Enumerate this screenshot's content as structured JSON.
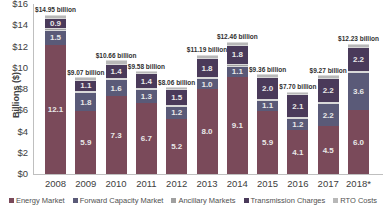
{
  "chart_data": {
    "type": "bar",
    "stacked": true,
    "title": "",
    "xlabel": "",
    "ylabel": "Billions ($)",
    "ylim": [
      0,
      16
    ],
    "yticks": [
      "$0",
      "$2",
      "$4",
      "$6",
      "$8",
      "$10",
      "$12",
      "$14",
      "$16"
    ],
    "categories": [
      "2008",
      "2009",
      "2010",
      "2011",
      "2012",
      "2013",
      "2014",
      "2015",
      "2016",
      "2017",
      "2018*"
    ],
    "totals": [
      14.95,
      9.07,
      10.66,
      9.58,
      8.06,
      11.19,
      12.46,
      9.36,
      7.7,
      9.27,
      12.23
    ],
    "total_labels": [
      "$14.95 billion",
      "$9.07 billion",
      "$10.66 billion",
      "$9.58 billion",
      "$8.06 billion",
      "$11.19 billion",
      "$12.46 billion",
      "$9.36 billion",
      "$7.70 billion",
      "$9.27 billion",
      "$12.23 billion"
    ],
    "series": [
      {
        "name": "Energy Market",
        "color": "#7a4a5a",
        "values": [
          12.1,
          5.9,
          7.3,
          6.7,
          5.2,
          8.0,
          9.1,
          5.9,
          4.1,
          4.5,
          6.0
        ],
        "labels": [
          "12.1",
          "5.9",
          "7.3",
          "6.7",
          "5.2",
          "8.0",
          "9.1",
          "5.9",
          "4.1",
          "4.5",
          "6.0"
        ]
      },
      {
        "name": "Forward Capacity Market",
        "color": "#5a5a78",
        "values": [
          1.5,
          1.8,
          1.6,
          1.3,
          1.2,
          1.0,
          1.1,
          1.1,
          1.2,
          2.2,
          3.6
        ],
        "labels": [
          "1.5",
          "1.8",
          "1.6",
          "1.3",
          "1.2",
          "1.0",
          "1.1",
          "1.1",
          "1.2",
          "2.2",
          "3.6"
        ]
      },
      {
        "name": "Ancillary Markets",
        "color": "#a0a0a0",
        "values": [
          0.15,
          0.07,
          0.06,
          0.08,
          0.06,
          0.09,
          0.16,
          0.06,
          0.05,
          0.07,
          0.13
        ],
        "labels": [
          "",
          "",
          "",
          "",
          "",
          "",
          "",
          "",
          "",
          "",
          ""
        ]
      },
      {
        "name": "Transmission Charges",
        "color": "#4a3a5a",
        "values": [
          0.9,
          1.1,
          1.4,
          1.4,
          1.5,
          1.8,
          1.8,
          2.0,
          2.1,
          2.2,
          2.2
        ],
        "labels": [
          "0.9",
          "1.1",
          "1.4",
          "1.4",
          "1.5",
          "1.8",
          "1.8",
          "2.0",
          "2.1",
          "2.2",
          "2.2"
        ]
      },
      {
        "name": "RTO Costs",
        "color": "#b8b8b8",
        "values": [
          0.3,
          0.2,
          0.3,
          0.2,
          0.2,
          0.3,
          0.3,
          0.3,
          0.25,
          0.3,
          0.3
        ],
        "labels": [
          "",
          "",
          "",
          "",
          "",
          "",
          "",
          "",
          "",
          "",
          ""
        ]
      }
    ],
    "legend_position": "bottom",
    "grid": false,
    "footnote": "Source: ISO New England (illegible small print)"
  },
  "legend": [
    {
      "label": "Energy Market",
      "color": "#7a4a5a"
    },
    {
      "label": "Forward Capacity Market",
      "color": "#5a5a78"
    },
    {
      "label": "Ancillary Markets",
      "color": "#a0a0a0"
    },
    {
      "label": "Transmission Charges",
      "color": "#4a3a5a"
    },
    {
      "label": "RTO Costs",
      "color": "#b8b8b8"
    }
  ]
}
